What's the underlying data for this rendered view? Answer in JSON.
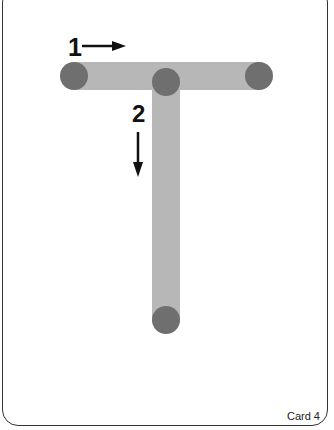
{
  "card": {
    "letter": "T",
    "label": "Card 4"
  },
  "strokes": [
    {
      "number": "1",
      "direction": "right"
    },
    {
      "number": "2",
      "direction": "down"
    }
  ],
  "colors": {
    "stroke": "#b7b7b7",
    "dot": "#6f6f6f",
    "text": "#111111"
  }
}
